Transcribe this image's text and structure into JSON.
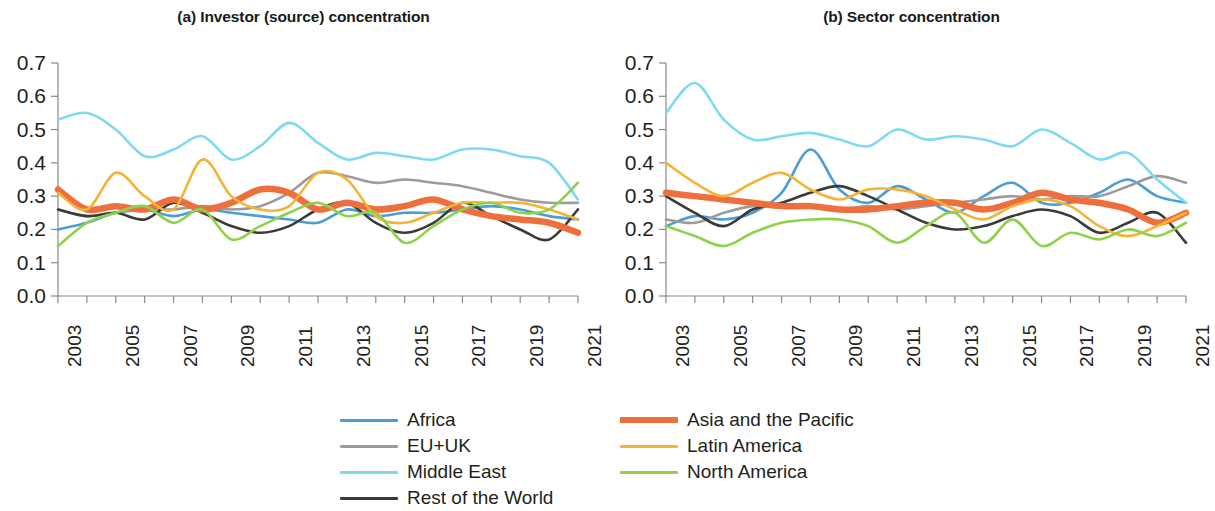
{
  "figure": {
    "background": "#ffffff",
    "panels": [
      {
        "id": "a",
        "title": "(a) Investor (source) concentration"
      },
      {
        "id": "b",
        "title": "(b) Sector concentration"
      }
    ]
  },
  "axes": {
    "y_ticks": [
      "0.7",
      "0.6",
      "0.5",
      "0.4",
      "0.3",
      "0.2",
      "0.1",
      "0.0"
    ],
    "x_ticks": [
      "2003",
      "2005",
      "2007",
      "2009",
      "2011",
      "2013",
      "2015",
      "2017",
      "2019",
      "2021"
    ]
  },
  "legend": {
    "columns": [
      {
        "items": [
          {
            "label": "Africa",
            "color": "#4a9dd6",
            "weight": "normal"
          },
          {
            "label": "EU+UK",
            "color": "#9c9c9c",
            "weight": "normal"
          },
          {
            "label": "Middle East",
            "color": "#7fd9f2",
            "weight": "normal"
          },
          {
            "label": "Rest of the World",
            "color": "#3a3a3a",
            "weight": "normal"
          }
        ]
      },
      {
        "items": [
          {
            "label": "Asia and the Pacific",
            "color": "#ef6f3c",
            "weight": "thick"
          },
          {
            "label": "Latin America",
            "color": "#f5b335",
            "weight": "normal"
          },
          {
            "label": "North America",
            "color": "#8fd14a",
            "weight": "normal"
          }
        ]
      }
    ]
  },
  "chart_data": [
    {
      "type": "line",
      "panel": "a",
      "title": "(a) Investor (source) concentration",
      "xlabel": "",
      "ylabel": "",
      "xlim": [
        2003,
        2021
      ],
      "ylim": [
        0.0,
        0.7
      ],
      "yticks": [
        0.0,
        0.1,
        0.2,
        0.3,
        0.4,
        0.5,
        0.6,
        0.7
      ],
      "xticks": [
        2003,
        2005,
        2007,
        2009,
        2011,
        2013,
        2015,
        2017,
        2019,
        2021
      ],
      "grid": false,
      "legend_position": "below",
      "x": [
        2003,
        2004,
        2005,
        2006,
        2007,
        2008,
        2009,
        2010,
        2011,
        2012,
        2013,
        2014,
        2015,
        2016,
        2017,
        2018,
        2019,
        2020,
        2021
      ],
      "series": [
        {
          "name": "Africa",
          "color": "#4a9dd6",
          "values": [
            0.2,
            0.22,
            0.25,
            0.26,
            0.24,
            0.26,
            0.25,
            0.24,
            0.23,
            0.22,
            0.26,
            0.24,
            0.25,
            0.25,
            0.26,
            0.27,
            0.26,
            0.24,
            0.23
          ]
        },
        {
          "name": "EU+UK",
          "color": "#9c9c9c",
          "values": [
            0.26,
            0.24,
            0.25,
            0.26,
            0.26,
            0.27,
            0.26,
            0.27,
            0.31,
            0.37,
            0.36,
            0.34,
            0.35,
            0.34,
            0.33,
            0.31,
            0.29,
            0.28,
            0.28
          ]
        },
        {
          "name": "Middle East",
          "color": "#7fd9f2",
          "values": [
            0.53,
            0.55,
            0.5,
            0.42,
            0.44,
            0.48,
            0.41,
            0.45,
            0.52,
            0.46,
            0.41,
            0.43,
            0.42,
            0.41,
            0.44,
            0.44,
            0.42,
            0.4,
            0.29
          ]
        },
        {
          "name": "Rest of the World",
          "color": "#3a3a3a",
          "values": [
            0.26,
            0.24,
            0.25,
            0.23,
            0.28,
            0.25,
            0.21,
            0.19,
            0.21,
            0.26,
            0.28,
            0.22,
            0.19,
            0.22,
            0.28,
            0.24,
            0.2,
            0.17,
            0.26
          ]
        },
        {
          "name": "Asia and the Pacific",
          "color": "#ef6f3c",
          "weight": "thick",
          "values": [
            0.32,
            0.26,
            0.27,
            0.26,
            0.29,
            0.26,
            0.28,
            0.32,
            0.31,
            0.26,
            0.28,
            0.26,
            0.27,
            0.29,
            0.26,
            0.24,
            0.23,
            0.22,
            0.19
          ]
        },
        {
          "name": "Latin America",
          "color": "#f5b335",
          "values": [
            0.31,
            0.26,
            0.37,
            0.3,
            0.26,
            0.41,
            0.3,
            0.26,
            0.27,
            0.37,
            0.35,
            0.24,
            0.22,
            0.25,
            0.28,
            0.28,
            0.28,
            0.26,
            0.23
          ]
        },
        {
          "name": "North America",
          "color": "#8fd14a",
          "values": [
            0.15,
            0.22,
            0.25,
            0.27,
            0.22,
            0.26,
            0.17,
            0.21,
            0.25,
            0.28,
            0.24,
            0.25,
            0.16,
            0.21,
            0.26,
            0.28,
            0.25,
            0.26,
            0.34
          ]
        }
      ]
    },
    {
      "type": "line",
      "panel": "b",
      "title": "(b) Sector concentration",
      "xlabel": "",
      "ylabel": "",
      "xlim": [
        2003,
        2021
      ],
      "ylim": [
        0.0,
        0.7
      ],
      "yticks": [
        0.0,
        0.1,
        0.2,
        0.3,
        0.4,
        0.5,
        0.6,
        0.7
      ],
      "xticks": [
        2003,
        2005,
        2007,
        2009,
        2011,
        2013,
        2015,
        2017,
        2019,
        2021
      ],
      "grid": false,
      "legend_position": "below",
      "x": [
        2003,
        2004,
        2005,
        2006,
        2007,
        2008,
        2009,
        2010,
        2011,
        2012,
        2013,
        2014,
        2015,
        2016,
        2017,
        2018,
        2019,
        2020,
        2021
      ],
      "series": [
        {
          "name": "Africa",
          "color": "#4a9dd6",
          "values": [
            0.21,
            0.24,
            0.23,
            0.25,
            0.31,
            0.44,
            0.32,
            0.28,
            0.33,
            0.29,
            0.25,
            0.3,
            0.34,
            0.28,
            0.28,
            0.31,
            0.35,
            0.3,
            0.28
          ]
        },
        {
          "name": "EU+UK",
          "color": "#9c9c9c",
          "values": [
            0.23,
            0.22,
            0.25,
            0.27,
            0.27,
            0.27,
            0.26,
            0.27,
            0.26,
            0.27,
            0.28,
            0.29,
            0.3,
            0.29,
            0.3,
            0.3,
            0.33,
            0.36,
            0.34
          ]
        },
        {
          "name": "Middle East",
          "color": "#7fd9f2",
          "values": [
            0.55,
            0.64,
            0.53,
            0.47,
            0.48,
            0.49,
            0.47,
            0.45,
            0.5,
            0.47,
            0.48,
            0.47,
            0.45,
            0.5,
            0.46,
            0.41,
            0.43,
            0.35,
            0.28
          ]
        },
        {
          "name": "Rest of the World",
          "color": "#3a3a3a",
          "values": [
            0.3,
            0.25,
            0.21,
            0.26,
            0.28,
            0.31,
            0.33,
            0.3,
            0.26,
            0.22,
            0.2,
            0.21,
            0.24,
            0.26,
            0.24,
            0.19,
            0.22,
            0.25,
            0.16
          ]
        },
        {
          "name": "Asia and the Pacific",
          "color": "#ef6f3c",
          "weight": "thick",
          "values": [
            0.31,
            0.3,
            0.29,
            0.28,
            0.27,
            0.27,
            0.26,
            0.26,
            0.27,
            0.28,
            0.28,
            0.26,
            0.28,
            0.31,
            0.29,
            0.28,
            0.26,
            0.22,
            0.25
          ]
        },
        {
          "name": "Latin America",
          "color": "#f5b335",
          "values": [
            0.4,
            0.34,
            0.3,
            0.34,
            0.37,
            0.32,
            0.29,
            0.32,
            0.32,
            0.3,
            0.26,
            0.23,
            0.27,
            0.29,
            0.27,
            0.21,
            0.18,
            0.21,
            0.25
          ]
        },
        {
          "name": "North America",
          "color": "#8fd14a",
          "values": [
            0.21,
            0.18,
            0.15,
            0.19,
            0.22,
            0.23,
            0.23,
            0.21,
            0.16,
            0.21,
            0.25,
            0.16,
            0.23,
            0.15,
            0.19,
            0.17,
            0.2,
            0.18,
            0.22
          ]
        }
      ]
    }
  ]
}
